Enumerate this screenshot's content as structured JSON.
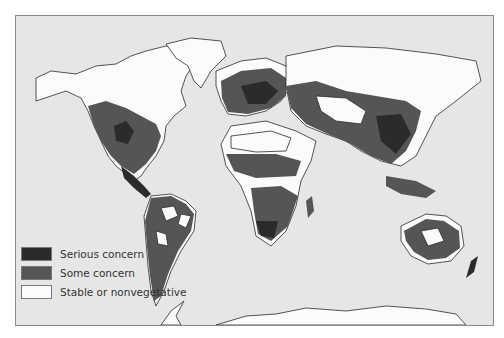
{
  "map": {
    "subject": "World map of vegetation concern",
    "legend": [
      {
        "label": "Serious concern",
        "color": "#2b2b2b"
      },
      {
        "label": "Some concern",
        "color": "#555555"
      },
      {
        "label": "Stable or nonvegetative",
        "color": "#fbfbfb"
      }
    ],
    "ocean_color": "#e6e6e6"
  }
}
